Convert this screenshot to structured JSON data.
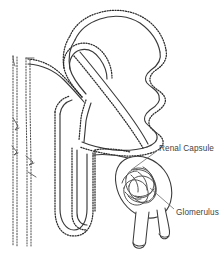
{
  "figure": {
    "type": "anatomical-line-drawing",
    "background_color": "#ffffff",
    "ink_color": "#3a3a3a",
    "label_color": "#434343",
    "width": 224,
    "height": 256
  },
  "labels": [
    {
      "id": "renal-capsule",
      "text": "Renal Capsule",
      "x": 159,
      "y": 145,
      "leader_from": [
        157,
        151
      ],
      "leader_to": [
        131,
        170
      ]
    },
    {
      "id": "glomerulus",
      "text": "Glomerulus",
      "x": 176,
      "y": 209,
      "leader_from": [
        174,
        209
      ],
      "leader_to": [
        150,
        188
      ]
    }
  ],
  "structures": [
    {
      "id": "collecting-duct-left",
      "name": "Collecting duct (far left)",
      "orientation": "vertical"
    },
    {
      "id": "collecting-duct-right",
      "name": "Collecting duct (inner left)",
      "orientation": "vertical"
    },
    {
      "id": "convoluted-tubule",
      "name": "Convoluted tubule",
      "orientation": "looping"
    },
    {
      "id": "loop-of-henle",
      "name": "Loop of Henle",
      "orientation": "hairpin"
    },
    {
      "id": "renal-capsule",
      "name": "Renal capsule (Bowman's capsule)",
      "orientation": "bulb"
    },
    {
      "id": "glomerulus",
      "name": "Glomerulus capillary tuft",
      "orientation": "coiled"
    },
    {
      "id": "arterioles",
      "name": "Afferent and efferent arterioles",
      "orientation": "paired-tubes"
    }
  ]
}
